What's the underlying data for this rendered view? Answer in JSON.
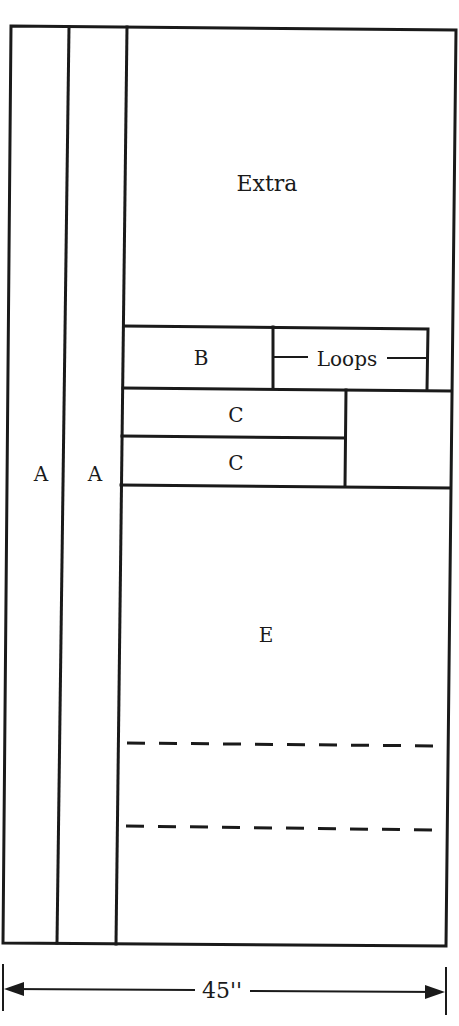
{
  "diagram": {
    "pieces": [
      {
        "id": "A1",
        "label": "A"
      },
      {
        "id": "A2",
        "label": "A"
      },
      {
        "id": "extra",
        "label": "Extra"
      },
      {
        "id": "B",
        "label": "B"
      },
      {
        "id": "loops",
        "label": "Loops"
      },
      {
        "id": "C1",
        "label": "C"
      },
      {
        "id": "C2",
        "label": "C"
      },
      {
        "id": "E",
        "label": "E"
      }
    ],
    "dimension": {
      "label": "45''",
      "orientation": "horizontal"
    },
    "fold_lines": 2,
    "colors": {
      "line": "#1a1a1a",
      "background": "#ffffff"
    }
  }
}
